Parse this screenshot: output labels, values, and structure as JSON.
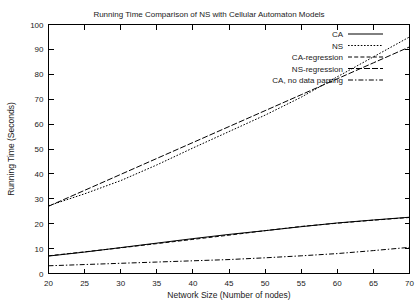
{
  "chart_data": {
    "type": "line",
    "title": "Running Time Comparison of NS with Cellular Automaton Models",
    "xlabel": "Network Size (Number of nodes)",
    "ylabel": "Running Time (Seconds)",
    "xlim": [
      20,
      70
    ],
    "ylim": [
      0,
      100
    ],
    "xticks": [
      20,
      25,
      30,
      35,
      40,
      45,
      50,
      55,
      60,
      65,
      70
    ],
    "yticks": [
      0,
      10,
      20,
      30,
      40,
      50,
      60,
      70,
      80,
      90,
      100
    ],
    "grid": false,
    "legend_position": "top-right",
    "x": [
      20,
      25,
      30,
      35,
      40,
      45,
      50,
      55,
      60,
      65,
      70
    ],
    "series": [
      {
        "name": "CA",
        "style": "solid",
        "values": [
          7.0,
          8.6,
          10.4,
          12.2,
          14.0,
          15.7,
          17.2,
          18.8,
          20.3,
          21.5,
          22.6
        ]
      },
      {
        "name": "NS",
        "style": "dotted",
        "values": [
          27.2,
          32.0,
          37.3,
          43.6,
          50.4,
          57.0,
          63.6,
          70.8,
          79.0,
          87.0,
          95.0
        ]
      },
      {
        "name": "CA-regression",
        "style": "dashed",
        "values": [
          7.1,
          8.7,
          10.3,
          12.0,
          13.7,
          15.4,
          17.2,
          18.9,
          20.2,
          21.4,
          22.5
        ]
      },
      {
        "name": "NS-regression",
        "style": "dashdot",
        "values": [
          27.0,
          33.4,
          39.8,
          46.2,
          52.6,
          59.0,
          65.4,
          71.8,
          78.2,
          84.6,
          91.0
        ]
      },
      {
        "name": "CA, no data parsing",
        "style": "dashdot2",
        "values": [
          3.1,
          3.6,
          4.1,
          4.6,
          5.1,
          5.6,
          6.3,
          7.1,
          8.0,
          9.2,
          10.5
        ]
      }
    ]
  },
  "legend": {
    "items": [
      {
        "label": "CA"
      },
      {
        "label": "NS"
      },
      {
        "label": "CA-regression"
      },
      {
        "label": "NS-regression"
      },
      {
        "label": "CA, no data parsing"
      }
    ]
  },
  "colors": {
    "axis": "#000000",
    "text": "#1a1a1a",
    "background": "#ffffff",
    "series": "#000000"
  }
}
